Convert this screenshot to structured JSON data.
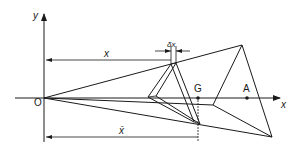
{
  "diagram": {
    "axes": {
      "x_label": "x",
      "y_label": "y",
      "origin_label": "O"
    },
    "points": {
      "centroid_label": "G",
      "point_a_label": "A"
    },
    "dimensions": {
      "slice_distance_label": "x",
      "slice_thickness_label": "δx",
      "centroid_distance_label": "x̄"
    },
    "colors": {
      "line": "#1a1a1a",
      "background": "#ffffff"
    }
  }
}
